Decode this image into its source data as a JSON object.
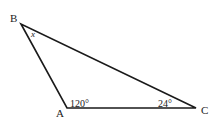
{
  "diagram": {
    "type": "triangle",
    "vertices": [
      {
        "label": "A",
        "x": 67,
        "y": 108,
        "label_x": 56,
        "label_y": 117
      },
      {
        "label": "B",
        "x": 21,
        "y": 24,
        "label_x": 10,
        "label_y": 22
      },
      {
        "label": "C",
        "x": 196,
        "y": 108,
        "label_x": 201,
        "label_y": 114
      }
    ],
    "angles": [
      {
        "at": "A",
        "text": "120°",
        "x": 70,
        "y": 107
      },
      {
        "at": "C",
        "text": "24°",
        "x": 158,
        "y": 107
      },
      {
        "at": "B",
        "text": "x",
        "x": 31,
        "y": 37
      }
    ],
    "stroke_color": "#1a1a1a",
    "background": "#ffffff"
  }
}
